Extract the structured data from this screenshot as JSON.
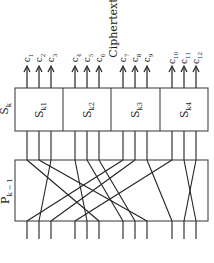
{
  "diagram": {
    "title": "Ciphertext",
    "sbox_row_label": "S",
    "sbox_row_label_sub": "k",
    "perm_label": "P",
    "perm_label_sub": "k − 1",
    "sboxes": [
      {
        "label": "S",
        "sub": "k1"
      },
      {
        "label": "S",
        "sub": "k2"
      },
      {
        "label": "S",
        "sub": "k3"
      },
      {
        "label": "S",
        "sub": "k4"
      }
    ],
    "outputs": [
      {
        "label": "c",
        "sub": "1"
      },
      {
        "label": "c",
        "sub": "2"
      },
      {
        "label": "c",
        "sub": "3"
      },
      {
        "label": "c",
        "sub": "4"
      },
      {
        "label": "c",
        "sub": "5"
      },
      {
        "label": "c",
        "sub": "6"
      },
      {
        "label": "c",
        "sub": "7"
      },
      {
        "label": "c",
        "sub": "8"
      },
      {
        "label": "c",
        "sub": "9"
      },
      {
        "label": "c",
        "sub": "10"
      },
      {
        "label": "c",
        "sub": "11"
      },
      {
        "label": "c",
        "sub": "12"
      }
    ],
    "wire_x": [
      27,
      39,
      51,
      75,
      87,
      99,
      123,
      135,
      147,
      172,
      184,
      196
    ],
    "permutation": [
      [
        27,
        99
      ],
      [
        39,
        147
      ],
      [
        51,
        39
      ],
      [
        75,
        87
      ],
      [
        87,
        123
      ],
      [
        99,
        135
      ],
      [
        123,
        27
      ],
      [
        135,
        51
      ],
      [
        147,
        172
      ],
      [
        172,
        75
      ],
      [
        184,
        196
      ],
      [
        196,
        184
      ]
    ],
    "line_color": "#222222"
  }
}
